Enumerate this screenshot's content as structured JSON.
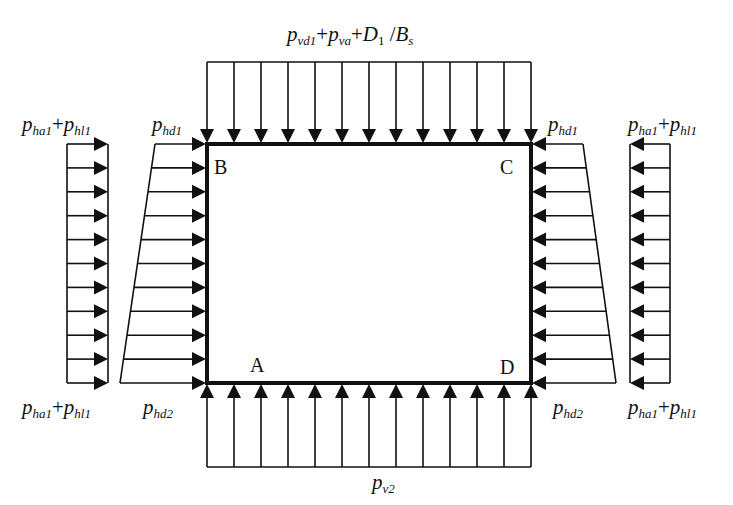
{
  "diagram": {
    "corners": {
      "B": "B",
      "C": "C",
      "A": "A",
      "D": "D"
    },
    "labels": {
      "top_load": {
        "p1": "p",
        "s1": "vd1",
        "plus1": "+",
        "p2": "p",
        "s2": "va",
        "plus2": "+",
        "D": "D",
        "Dsub": "1",
        "slash": " /",
        "B": "B",
        "Bsub": "s"
      },
      "bottom_load": {
        "p": "p",
        "s": "v2"
      },
      "left_top_uniform": {
        "p1": "p",
        "s1": "ha1",
        "plus": "+",
        "p2": "p",
        "s2": "hl1"
      },
      "left_bottom_uniform": {
        "p1": "p",
        "s1": "ha1",
        "plus": "+",
        "p2": "p",
        "s2": "hl1"
      },
      "right_top_uniform": {
        "p1": "p",
        "s1": "ha1",
        "plus": "+",
        "p2": "p",
        "s2": "hl1"
      },
      "right_bottom_uniform": {
        "p1": "p",
        "s1": "ha1",
        "plus": "+",
        "p2": "p",
        "s2": "hl1"
      },
      "left_top_trap": {
        "p": "p",
        "s": "hd1"
      },
      "left_bottom_trap": {
        "p": "p",
        "s": "hd2"
      },
      "right_top_trap": {
        "p": "p",
        "s": "hd1"
      },
      "right_bottom_trap": {
        "p": "p",
        "s": "hd2"
      }
    },
    "geometry": {
      "box": {
        "left": 207,
        "top": 144,
        "right": 531,
        "bottom": 383
      },
      "top_arrow_count": 13,
      "bottom_arrow_count": 13,
      "side_arrow_count": 11,
      "top_bar_y": 62,
      "bottom_bar_y": 467,
      "left_uniform_x": [
        67,
        108
      ],
      "right_uniform_x": [
        630,
        670
      ],
      "left_trap_outer_x": {
        "top": 155,
        "bottom": 120
      },
      "right_trap_outer_x": {
        "top": 583,
        "bottom": 616
      }
    },
    "colors": {
      "line": "#111111",
      "background": "#ffffff"
    }
  }
}
